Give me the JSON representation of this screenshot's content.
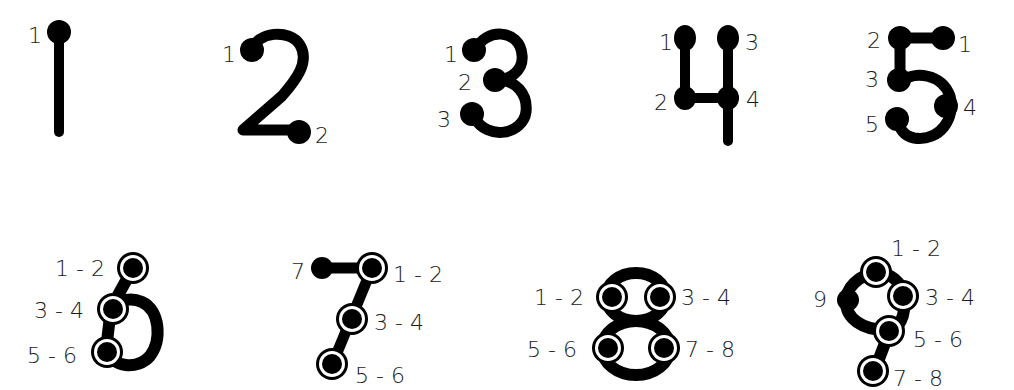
{
  "diagram": {
    "colors": {
      "ink": "#000000",
      "label": "#1a1a1a",
      "background": "#ffffff"
    },
    "legend": {
      "single_dot": "touch once",
      "ringed_dot": "touch twice (double point)"
    },
    "numerals": [
      {
        "digit": "1",
        "row": 1,
        "points": [
          {
            "label": "1",
            "type": "single"
          }
        ]
      },
      {
        "digit": "2",
        "row": 1,
        "points": [
          {
            "label": "1",
            "type": "single"
          },
          {
            "label": "2",
            "type": "single"
          }
        ]
      },
      {
        "digit": "3",
        "row": 1,
        "points": [
          {
            "label": "1",
            "type": "single"
          },
          {
            "label": "2",
            "type": "single"
          },
          {
            "label": "3",
            "type": "single"
          }
        ]
      },
      {
        "digit": "4",
        "row": 1,
        "points": [
          {
            "label": "1",
            "type": "single"
          },
          {
            "label": "2",
            "type": "single"
          },
          {
            "label": "3",
            "type": "single"
          },
          {
            "label": "4",
            "type": "single"
          }
        ]
      },
      {
        "digit": "5",
        "row": 1,
        "points": [
          {
            "label": "2",
            "type": "single"
          },
          {
            "label": "1",
            "type": "single"
          },
          {
            "label": "3",
            "type": "single"
          },
          {
            "label": "4",
            "type": "single"
          },
          {
            "label": "5",
            "type": "single"
          }
        ]
      },
      {
        "digit": "6",
        "row": 2,
        "points": [
          {
            "label": "1 - 2",
            "type": "double"
          },
          {
            "label": "3 - 4",
            "type": "double"
          },
          {
            "label": "5 - 6",
            "type": "double"
          }
        ]
      },
      {
        "digit": "7",
        "row": 2,
        "points": [
          {
            "label": "7",
            "type": "single"
          },
          {
            "label": "1 - 2",
            "type": "double"
          },
          {
            "label": "3 - 4",
            "type": "double"
          },
          {
            "label": "5 - 6",
            "type": "double"
          }
        ]
      },
      {
        "digit": "8",
        "row": 2,
        "points": [
          {
            "label": "1 - 2",
            "type": "double"
          },
          {
            "label": "3 - 4",
            "type": "double"
          },
          {
            "label": "5 - 6",
            "type": "double"
          },
          {
            "label": "7 - 8",
            "type": "double"
          }
        ]
      },
      {
        "digit": "9",
        "row": 2,
        "points": [
          {
            "label": "1 - 2",
            "type": "double"
          },
          {
            "label": "9",
            "type": "single"
          },
          {
            "label": "3 - 4",
            "type": "double"
          },
          {
            "label": "5 - 6",
            "type": "double"
          },
          {
            "label": "7 - 8",
            "type": "double"
          }
        ]
      }
    ]
  }
}
